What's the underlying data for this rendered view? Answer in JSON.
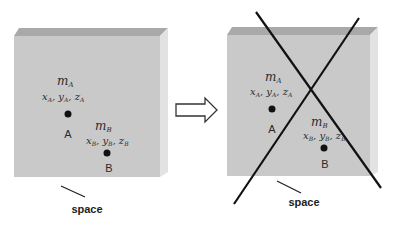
{
  "figure": {
    "left_panel": {
      "name": "space-before",
      "mass_a": {
        "symbol": "m",
        "sub": "A"
      },
      "coords_a": {
        "x": "x",
        "y": "y",
        "z": "z",
        "sub": "A"
      },
      "point_a_label": "A",
      "mass_b": {
        "symbol": "m",
        "sub": "B"
      },
      "coords_b": {
        "x": "x",
        "y": "y",
        "z": "z",
        "sub": "B"
      },
      "point_b_label": "B",
      "space_label": "space"
    },
    "arrow": {
      "type": "outline-right-arrow"
    },
    "right_panel": {
      "name": "space-crossed-out",
      "mass_a": {
        "symbol": "m",
        "sub": "A"
      },
      "coords_a": {
        "x": "x",
        "y": "y",
        "z": "z",
        "sub": "A"
      },
      "point_a_label": "A",
      "mass_b": {
        "symbol": "m",
        "sub": "B"
      },
      "coords_b": {
        "x": "x",
        "y": "y",
        "z": "z",
        "sub": "B"
      },
      "point_b_label": "B",
      "space_label": "space",
      "cross_out": true
    },
    "colors": {
      "front_face": "#c9c9c9",
      "top_face": "#a9a9a9",
      "side_face": "#e2e2e2",
      "ink": "#1a1a1a"
    }
  }
}
